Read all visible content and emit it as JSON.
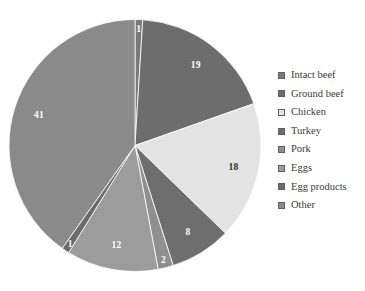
{
  "chart_data": {
    "type": "pie",
    "title": "",
    "subtitle": "",
    "xlabel": "",
    "ylabel": "",
    "grid": false,
    "legend_position": "right",
    "value_unit": "percent",
    "start_angle_deg": 0,
    "direction": "clockwise",
    "categories": [
      "Intact beef",
      "Ground beef",
      "Chicken",
      "Turkey",
      "Pork",
      "Eggs",
      "Egg products",
      "Other"
    ],
    "values": [
      1,
      19,
      18,
      8,
      2,
      12,
      1,
      41
    ],
    "labels": [
      "1",
      "19",
      "18",
      "8",
      "2",
      "12",
      "1",
      "41"
    ],
    "colors": [
      "#7a7a7a",
      "#6d6d6d",
      "#e3e3e3",
      "#6e6e6e",
      "#8f8f8f",
      "#9c9c9c",
      "#6b6b6b",
      "#8a8a8a"
    ],
    "label_colors": [
      "#ffffff",
      "#ffffff",
      "#2c2c2c",
      "#ffffff",
      "#ffffff",
      "#ffffff",
      "#ffffff",
      "#ffffff"
    ],
    "slices": [
      {
        "name": "Intact beef",
        "value": 1,
        "label": "1",
        "color": "#7a7a7a",
        "label_color": "#ffffff"
      },
      {
        "name": "Ground beef",
        "value": 19,
        "label": "19",
        "color": "#6d6d6d",
        "label_color": "#ffffff"
      },
      {
        "name": "Chicken",
        "value": 18,
        "label": "18",
        "color": "#e3e3e3",
        "label_color": "#2c2c2c"
      },
      {
        "name": "Turkey",
        "value": 8,
        "label": "8",
        "color": "#6e6e6e",
        "label_color": "#ffffff"
      },
      {
        "name": "Pork",
        "value": 2,
        "label": "2",
        "color": "#8f8f8f",
        "label_color": "#ffffff"
      },
      {
        "name": "Eggs",
        "value": 12,
        "label": "12",
        "color": "#9c9c9c",
        "label_color": "#ffffff"
      },
      {
        "name": "Egg products",
        "value": 1,
        "label": "1",
        "color": "#6b6b6b",
        "label_color": "#ffffff"
      },
      {
        "name": "Other",
        "value": 41,
        "label": "41",
        "color": "#8a8a8a",
        "label_color": "#ffffff"
      }
    ]
  },
  "legend": {
    "items": [
      {
        "label": "Intact beef",
        "color": "#7a7a7a"
      },
      {
        "label": "Ground beef",
        "color": "#6d6d6d"
      },
      {
        "label": "Chicken",
        "color": "#e3e3e3"
      },
      {
        "label": "Turkey",
        "color": "#6e6e6e"
      },
      {
        "label": "Pork",
        "color": "#8f8f8f"
      },
      {
        "label": "Eggs",
        "color": "#9c9c9c"
      },
      {
        "label": "Egg products",
        "color": "#6b6b6b"
      },
      {
        "label": "Other",
        "color": "#8a8a8a"
      }
    ]
  }
}
